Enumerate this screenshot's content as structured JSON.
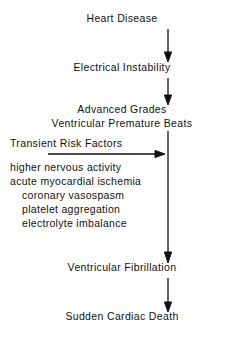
{
  "diagram": {
    "type": "flowchart",
    "stroke_color": "#111111",
    "background_color": "#ffffff",
    "nodes": [
      {
        "id": "heart-disease",
        "lines": [
          "Heart Disease"
        ]
      },
      {
        "id": "electrical-instability",
        "lines": [
          "Electrical Instability"
        ]
      },
      {
        "id": "advanced-grades",
        "lines": [
          "Advanced Grades",
          "Ventricular Premature Beats"
        ]
      },
      {
        "id": "ventricular-fibrillation",
        "lines": [
          "Ventricular Fibrillation"
        ]
      },
      {
        "id": "sudden-cardiac-death",
        "lines": [
          "Sudden Cardiac Death"
        ]
      }
    ],
    "risk_factors": {
      "title": "Transient Risk Factors",
      "items": [
        {
          "text": "higher nervous activity",
          "indent": false
        },
        {
          "text": "acute myocardial ischemia",
          "indent": false
        },
        {
          "text": "coronary vasospasm",
          "indent": true
        },
        {
          "text": "platelet aggregation",
          "indent": true
        },
        {
          "text": "electrolyte imbalance",
          "indent": true
        }
      ]
    },
    "arrows": [
      {
        "id": "arrow-heart-disease-to-electrical-instability",
        "direction": "down"
      },
      {
        "id": "arrow-electrical-instability-to-advanced-grades",
        "direction": "down"
      },
      {
        "id": "arrow-advanced-grades-to-ventricular-fibrillation",
        "direction": "down"
      },
      {
        "id": "arrow-risk-factors-to-spine",
        "direction": "right"
      },
      {
        "id": "arrow-ventricular-fibrillation-to-sudden-cardiac-death",
        "direction": "down"
      }
    ]
  }
}
